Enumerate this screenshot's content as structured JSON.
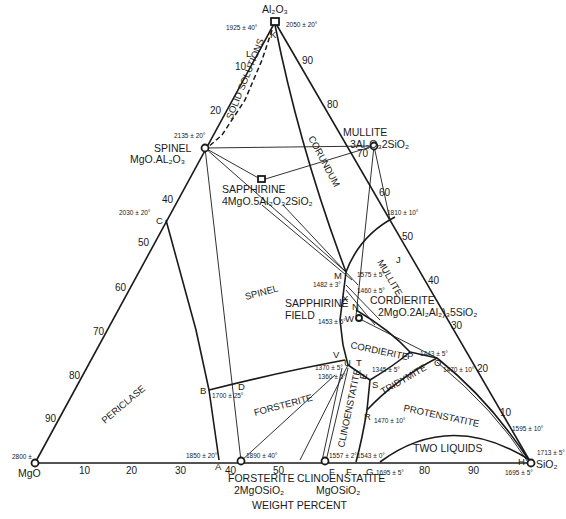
{
  "diagram": {
    "axis_label": "WEIGHT PERCENT",
    "vertices": {
      "top": {
        "label": "Al₂O₃",
        "temps": [
          "1925 ± 40°",
          "2050 ± 20°"
        ],
        "point": "K"
      },
      "left": {
        "label": "MgO",
        "temp": "2800 ±"
      },
      "right": {
        "label": "SiO₂",
        "temps": [
          "1713 ± 5°",
          "1695 ± 5°"
        ],
        "point": "H"
      }
    },
    "compounds": {
      "spinel": {
        "name": "SPINEL",
        "formula": "MgO.AL₂O₃",
        "temp": "2135 ± 20°"
      },
      "mullite": {
        "name": "MULLITE",
        "formula": "3Al₂O₃2SiO₂"
      },
      "sapphirine": {
        "name": "SAPPHIRINE",
        "formula": "4MgO.5Al₂O₃2SiO₂"
      },
      "cordierite": {
        "name": "CORDIERITE",
        "formula": "2MgO.2Al₂Al₂)₃5SiO₂"
      },
      "forsterite": {
        "name": "FORSTERITE",
        "formula": "2MgOSiO₂"
      },
      "clinoenstatite": {
        "name": "CLINOENSTATITE",
        "formula": "MgOSiO₂"
      }
    },
    "fields": {
      "solid_solutions": "SOLID SOLUTIONS",
      "corundum": "CORUNDUM",
      "spinel": "SPINEL",
      "mullite": "MULLITE",
      "sapphirine_field_1": "SAPPHIRINE",
      "sapphirine_field_2": "FIELD",
      "cordierite": "CORDIERITE",
      "tridymite": "TRIDYMITE",
      "protenstatite": "PROTENSTATITE",
      "forsterite": "FORSTERITE",
      "periclase": "PERICLASE",
      "clinoenstatite": "CLINOENSTATITE",
      "two_liquids": "TWO LIQUIDS"
    },
    "points": {
      "K": "K",
      "L": "L",
      "C": "C",
      "B": "B",
      "D": "D",
      "A": "A",
      "M": "M",
      "J": "J",
      "X": "X",
      "N": "N",
      "W": "W",
      "V": "V",
      "U": "U",
      "T": "T",
      "S": "S",
      "R": "R",
      "P": "P",
      "O": "O",
      "E": "E",
      "F1": "F",
      "F2": "F",
      "G": "G",
      "H": "H",
      "Q": "Q"
    },
    "temperatures": {
      "C": "2030 ± 20°",
      "B": "1700 ± 25°",
      "A": "1850 ± 20°",
      "forsterite": "1890 ± 40°",
      "M": "1575 ± 5°",
      "J": "1810 ± 10°",
      "X": "1482 ± 3°",
      "N": "1460 ± 5°",
      "W": "1453 ± 5°",
      "V": "1370 ± 5°",
      "U": "1360 ± 5°",
      "S": "1345 ± 5°",
      "P": "1443 ± 5°",
      "O": "1470 ± 10°",
      "R": "1470 ± 10°",
      "clinoenstatite": "1557 ± 2°",
      "G_top": "1543 ± 0°",
      "G": "1695 ± 5°",
      "near_H": "1595 ± 10°"
    },
    "ticks": {
      "bottom": [
        "10",
        "20",
        "30",
        "40",
        "50",
        "80",
        "90"
      ],
      "left": [
        "10",
        "20",
        "40",
        "50",
        "60",
        "70",
        "80",
        "90"
      ],
      "right": [
        "90",
        "80",
        "70",
        "60",
        "50",
        "40",
        "30",
        "20",
        "10"
      ]
    }
  }
}
